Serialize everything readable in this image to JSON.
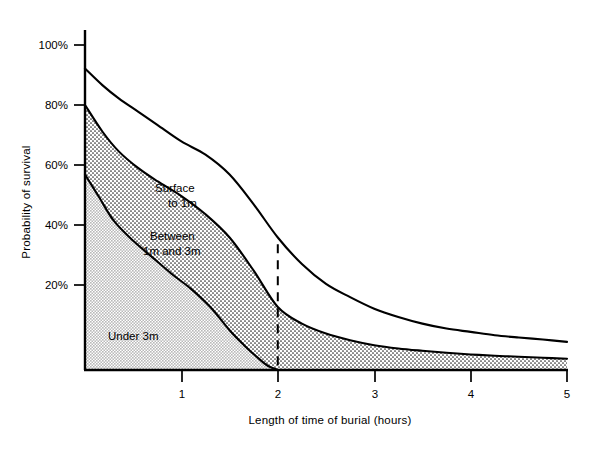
{
  "chart_data": {
    "type": "area",
    "title": "",
    "xlabel": "Length of time of burial (hours)",
    "ylabel": "Probability of survival",
    "xlim": [
      0,
      5
    ],
    "ylim": [
      0,
      105
    ],
    "xticks": [
      "1",
      "2",
      "3",
      "4",
      "5"
    ],
    "xtick_values": [
      1,
      2,
      3,
      4,
      5
    ],
    "yticks": [
      "20%",
      "40%",
      "60%",
      "80%",
      "100%"
    ],
    "ytick_values": [
      20,
      40,
      60,
      80,
      100
    ],
    "grid": false,
    "legend": "inline annotations",
    "annotations": [
      {
        "text_line1": "Surface",
        "text_line2": "to 1m",
        "x": 1.25,
        "y": 48
      },
      {
        "text_line1": "Between",
        "text_line2": "1m and 3m",
        "x": 1.2,
        "y": 36
      },
      {
        "text_line1": "Under 3m",
        "text_line2": "",
        "x": 0.35,
        "y": 11
      }
    ],
    "marker_line": {
      "label": "",
      "x": 2,
      "style": "dashed",
      "y_top": 38,
      "y_bottom": 0
    },
    "series": [
      {
        "name": "Surface to 1m",
        "fill": "white",
        "x": [
          0,
          0.18,
          0.35,
          0.55,
          0.75,
          1.0,
          1.25,
          1.5,
          1.75,
          2.0,
          2.25,
          2.5,
          2.75,
          3.0,
          3.25,
          3.5,
          3.75,
          4.0,
          4.25,
          4.5,
          4.75,
          5.0
        ],
        "values": [
          91,
          86,
          82,
          78,
          74,
          69,
          65,
          59,
          50,
          40,
          32,
          26,
          22,
          18.5,
          16,
          14,
          12.5,
          11.5,
          10.5,
          9.8,
          9.2,
          8.5
        ]
      },
      {
        "name": "Between 1m and 3m",
        "fill": "dotted",
        "x": [
          0,
          0.18,
          0.35,
          0.55,
          0.75,
          1.0,
          1.25,
          1.5,
          1.75,
          2.0,
          2.25,
          2.5,
          2.75,
          3.0,
          3.25,
          3.5,
          3.75,
          4.0,
          4.25,
          4.5,
          4.75,
          5.0
        ],
        "values": [
          80,
          72,
          66,
          61,
          57,
          52.5,
          47,
          40,
          30,
          19,
          14,
          11,
          9,
          7.5,
          6.5,
          5.8,
          5.2,
          4.7,
          4.3,
          4.0,
          3.7,
          3.4
        ]
      },
      {
        "name": "Under 3m",
        "fill": "gray",
        "x": [
          0,
          0.15,
          0.3,
          0.5,
          0.7,
          0.9,
          1.1,
          1.3,
          1.5,
          1.65,
          1.8,
          1.9,
          2.0
        ],
        "values": [
          59,
          52,
          45,
          39,
          34,
          29,
          24.5,
          19,
          12,
          7.5,
          3.5,
          1.2,
          0
        ]
      }
    ]
  },
  "labels": {
    "series_surface_line1": "Surface",
    "series_surface_line2": "to 1m",
    "series_between_line1": "Between",
    "series_between_line2": "1m and 3m",
    "series_under": "Under 3m",
    "xaxis_title": "Length of time of burial (hours)",
    "yaxis_title": "Probability of survival",
    "ytick_100": "100%",
    "ytick_80": "80%",
    "ytick_60": "60%",
    "ytick_40": "40%",
    "ytick_20": "20%",
    "xtick_1": "1",
    "xtick_2": "2",
    "xtick_3": "3",
    "xtick_4": "4",
    "xtick_5": "5"
  },
  "colors": {
    "line": "#000000",
    "gray_fill": "#d2d2d2",
    "dot_fill": "#ffffff",
    "background": "#ffffff"
  }
}
